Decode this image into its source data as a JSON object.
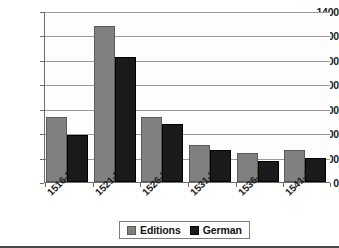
{
  "chart_data": {
    "type": "bar",
    "title": "",
    "subtitle": "",
    "xlabel": "",
    "ylabel": "",
    "categories": [
      "1516-20",
      "1521-25",
      "1526-30",
      "1531-35",
      "1536-40",
      "1541-45"
    ],
    "series": [
      {
        "name": "Editions",
        "color": "#808080",
        "values": [
          535,
          1280,
          530,
          305,
          235,
          260
        ]
      },
      {
        "name": "German",
        "color": "#1a1a1a",
        "values": [
          385,
          1020,
          475,
          265,
          175,
          200
        ]
      }
    ],
    "ylim": [
      0,
      1400
    ],
    "ytick_labels": [
      "0",
      "200",
      "400",
      "600",
      "800",
      "1000",
      "1200",
      "1400"
    ],
    "ytick_values": [
      0,
      200,
      400,
      600,
      800,
      1000,
      1200,
      1400
    ],
    "grid": true,
    "legend_position": "bottom-center",
    "legend_entries": [
      "Editions",
      "German"
    ]
  }
}
